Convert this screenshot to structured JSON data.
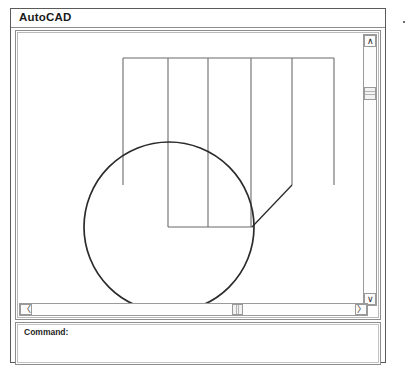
{
  "window": {
    "title": "AutoCAD"
  },
  "command_window": {
    "prompt": "Command:"
  },
  "scrollbars": {
    "vertical": {
      "up_arrow_glyph": "∧",
      "down_arrow_glyph": "∨"
    },
    "horizontal": {
      "left_arrow_glyph": "〈",
      "right_arrow_glyph": "〉"
    }
  },
  "drawing": {
    "stroke_color": "#2b2b2b",
    "thin_stroke_color": "#6b6b6b",
    "circle": {
      "cx": 149,
      "cy": 192,
      "r": 85
    },
    "top_rail": {
      "x1": 103,
      "y1": 23,
      "x2": 314,
      "y2": 23
    },
    "bottom_rail": {
      "x1": 148,
      "y1": 192,
      "x2": 232,
      "y2": 192
    },
    "verticals": [
      {
        "x": 103,
        "y1": 23,
        "y2": 150
      },
      {
        "x": 148,
        "y1": 23,
        "y2": 192
      },
      {
        "x": 188,
        "y1": 23,
        "y2": 192
      },
      {
        "x": 231,
        "y1": 23,
        "y2": 192
      },
      {
        "x": 272,
        "y1": 23,
        "y2": 150
      },
      {
        "x": 314,
        "y1": 23,
        "y2": 150
      }
    ],
    "diagonal": {
      "x1": 272,
      "y1": 150,
      "x2": 232,
      "y2": 192
    }
  }
}
